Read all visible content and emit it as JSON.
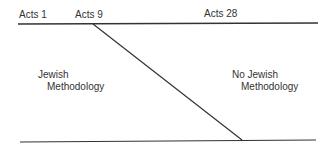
{
  "diagram": {
    "top_labels": [
      {
        "text": "Acts 1",
        "x": 18,
        "y": 9
      },
      {
        "text": "Acts 9",
        "x": 75,
        "y": 9
      },
      {
        "text": "Acts 28",
        "x": 204,
        "y": 8
      }
    ],
    "regions": {
      "left": {
        "line1": "Jewish",
        "line2": "Methodology"
      },
      "right": {
        "line1": "No Jewish",
        "line2": "Methodology"
      }
    },
    "lines": {
      "top": {
        "x1": 18,
        "y1": 24,
        "x2": 318,
        "y2": 23
      },
      "bottom": {
        "x1": 20,
        "y1": 142,
        "x2": 316,
        "y2": 140
      },
      "diagonal": {
        "x1": 93,
        "y1": 24,
        "x2": 242,
        "y2": 140
      }
    },
    "line_color": "#333333"
  }
}
